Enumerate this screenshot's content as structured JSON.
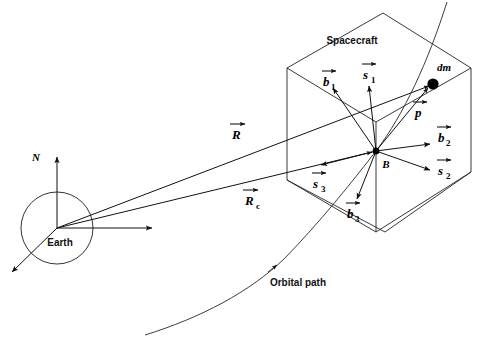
{
  "figure": {
    "type": "technical-diagram",
    "background_color": "#ffffff",
    "line_color": "#111111",
    "width": 489,
    "height": 338
  },
  "labels": {
    "spacecraft": "Spacecraft",
    "earth": "Earth",
    "orbital_path": "Orbital path",
    "north_axis": "N",
    "body_origin": "B",
    "mass_element": "dm"
  },
  "vectors": [
    {
      "id": "R",
      "symbol": "R",
      "subscript": "",
      "label": "R",
      "description": "position vector from Earth center to mass element dm"
    },
    {
      "id": "Rc",
      "symbol": "R",
      "subscript": "c",
      "label": "Rc",
      "description": "position vector from Earth center to spacecraft body origin B"
    },
    {
      "id": "rho",
      "symbol": "p",
      "subscript": "",
      "label": "p",
      "description": "position vector from body origin B to mass element dm"
    },
    {
      "id": "b1",
      "symbol": "b",
      "subscript": "1",
      "label": "b1",
      "description": "body frame basis vector 1"
    },
    {
      "id": "b2",
      "symbol": "b",
      "subscript": "2",
      "label": "b2",
      "description": "body frame basis vector 2"
    },
    {
      "id": "b3",
      "symbol": "b",
      "subscript": "3",
      "label": "b3",
      "description": "body frame basis vector 3"
    },
    {
      "id": "s1",
      "symbol": "s",
      "subscript": "1",
      "label": "s1",
      "description": "reference frame basis vector 1"
    },
    {
      "id": "s2",
      "symbol": "s",
      "subscript": "2",
      "label": "s2",
      "description": "reference frame basis vector 2"
    },
    {
      "id": "s3",
      "symbol": "s",
      "subscript": "3",
      "label": "s3",
      "description": "reference frame basis vector 3"
    }
  ],
  "objects": {
    "earth_circle": {
      "cx": 57,
      "cy": 228,
      "r": 36
    },
    "dm_dot": {
      "cx": 433,
      "cy": 84,
      "r": 5.5
    },
    "body_origin_dot": {
      "cx": 376,
      "cy": 151,
      "r": 3.2
    }
  },
  "symbols": {
    "R": "R",
    "Rc_base": "R",
    "Rc_sub": "c",
    "rho": "p",
    "b": "b",
    "s": "s",
    "one": "1",
    "two": "2",
    "three": "3"
  }
}
